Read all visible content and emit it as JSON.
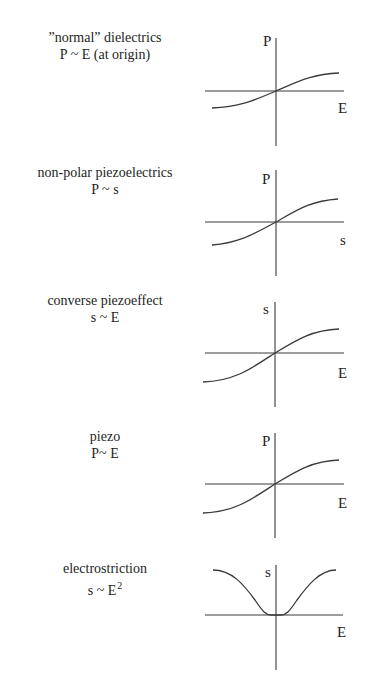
{
  "diagram": {
    "panels": [
      {
        "id": "normal-dielectrics",
        "title": "”normal” dielectrics",
        "relation": "P ~ E (at origin)",
        "relation_sup": "",
        "y_axis_label": "P",
        "x_axis_label": "E",
        "curve_shape": "s-curve"
      },
      {
        "id": "non-polar-piezoelectrics",
        "title": "non-polar piezoelectrics",
        "relation": "P ~ s",
        "relation_sup": "",
        "y_axis_label": "P",
        "x_axis_label": "s",
        "curve_shape": "s-curve"
      },
      {
        "id": "converse-piezoeffect",
        "title": "converse piezoeffect",
        "relation": "s ~ E",
        "relation_sup": "",
        "y_axis_label": "s",
        "x_axis_label": "E",
        "curve_shape": "s-curve"
      },
      {
        "id": "piezo",
        "title": "piezo",
        "relation": "P~ E",
        "relation_sup": "",
        "y_axis_label": "P",
        "x_axis_label": "E",
        "curve_shape": "s-curve"
      },
      {
        "id": "electrostriction",
        "title": "electrostriction",
        "relation": "s ~ E",
        "relation_sup": "2",
        "y_axis_label": "s",
        "x_axis_label": "E",
        "curve_shape": "u-curve"
      }
    ]
  },
  "geometry": {
    "captions": [
      {
        "top": 29
      },
      {
        "top": 164
      },
      {
        "top": 292
      },
      {
        "top": 428
      },
      {
        "top": 560
      }
    ],
    "plots": [
      {
        "vaxis": {
          "x": 276,
          "y1": 38,
          "y2": 146
        },
        "haxis": {
          "y": 91,
          "x1": 205,
          "x2": 344
        },
        "curve": "M 212 108 C 240 107, 255 100, 276 91 C 297 82, 312 74, 339 73",
        "ylabel": {
          "x": 263,
          "y": 46
        },
        "xlabel": {
          "x": 338,
          "y": 113
        }
      },
      {
        "vaxis": {
          "x": 276,
          "y1": 170,
          "y2": 276
        },
        "haxis": {
          "y": 222,
          "x1": 205,
          "x2": 344
        },
        "curve": "M 212 245 C 240 243, 255 233, 276 222 C 297 210, 310 201, 338 199",
        "ylabel": {
          "x": 262,
          "y": 184
        },
        "xlabel": {
          "x": 340,
          "y": 245
        }
      },
      {
        "vaxis": {
          "x": 275,
          "y1": 302,
          "y2": 407
        },
        "haxis": {
          "y": 353,
          "x1": 205,
          "x2": 344
        },
        "curve": "M 203 382 C 235 381, 252 368, 275 353 C 298 339, 313 330, 339 329",
        "ylabel": {
          "x": 263,
          "y": 314
        },
        "xlabel": {
          "x": 338,
          "y": 378
        }
      },
      {
        "vaxis": {
          "x": 275,
          "y1": 433,
          "y2": 538
        },
        "haxis": {
          "y": 484,
          "x1": 205,
          "x2": 344
        },
        "curve": "M 203 513 C 235 512, 252 499, 275 484 C 298 470, 313 461, 339 460",
        "ylabel": {
          "x": 262,
          "y": 446
        },
        "xlabel": {
          "x": 338,
          "y": 508
        }
      },
      {
        "vaxis": {
          "x": 276,
          "y1": 565,
          "y2": 670
        },
        "haxis": {
          "y": 615,
          "x1": 205,
          "x2": 343
        },
        "curve": "M 213 570 C 232 570, 244 585, 255 600 C 263 612, 266 615, 271 615 L 281 615 C 286 615, 289 612, 297 600 C 308 585, 320 570, 336 570",
        "ylabel": {
          "x": 265,
          "y": 577
        },
        "xlabel": {
          "x": 337,
          "y": 637
        }
      }
    ]
  },
  "chart_data": [
    {
      "type": "line",
      "title": "”normal” dielectrics — P ~ E (at origin)",
      "xlabel": "E",
      "ylabel": "P",
      "x": [
        -1.0,
        -0.5,
        0.0,
        0.5,
        1.0
      ],
      "values": [
        -0.55,
        -0.35,
        0.0,
        0.35,
        0.55
      ],
      "grid": false,
      "shape": "saturating s-curve through origin"
    },
    {
      "type": "line",
      "title": "non-polar piezoelectrics — P ~ s",
      "xlabel": "s",
      "ylabel": "P",
      "x": [
        -1.0,
        -0.5,
        0.0,
        0.5,
        1.0
      ],
      "values": [
        -0.7,
        -0.45,
        0.0,
        0.45,
        0.7
      ],
      "grid": false,
      "shape": "saturating s-curve through origin"
    },
    {
      "type": "line",
      "title": "converse piezoeffect — s ~ E",
      "xlabel": "E",
      "ylabel": "s",
      "x": [
        -1.0,
        -0.5,
        0.0,
        0.5,
        1.0
      ],
      "values": [
        -0.85,
        -0.55,
        0.0,
        0.5,
        0.72
      ],
      "grid": false,
      "shape": "saturating s-curve through origin"
    },
    {
      "type": "line",
      "title": "piezo — P~ E",
      "xlabel": "E",
      "ylabel": "P",
      "x": [
        -1.0,
        -0.5,
        0.0,
        0.5,
        1.0
      ],
      "values": [
        -0.85,
        -0.55,
        0.0,
        0.5,
        0.72
      ],
      "grid": false,
      "shape": "saturating s-curve through origin"
    },
    {
      "type": "line",
      "title": "electrostriction — s ~ E^2",
      "xlabel": "E",
      "ylabel": "s",
      "x": [
        -1.0,
        -0.5,
        -0.1,
        0.0,
        0.1,
        0.5,
        1.0
      ],
      "values": [
        1.0,
        0.6,
        0.02,
        0.0,
        0.02,
        0.6,
        1.0
      ],
      "grid": false,
      "shape": "symmetric U / bell-inverted curve with flat minimum at origin, saturating at large |E|"
    }
  ]
}
